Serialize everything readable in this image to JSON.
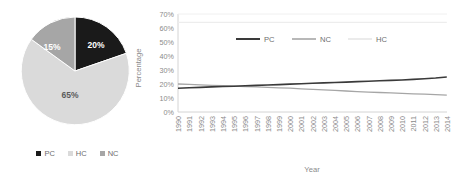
{
  "chart_data": [
    {
      "type": "pie",
      "title": "",
      "labels": [
        "PC",
        "HC",
        "NC"
      ],
      "values": [
        20,
        65,
        15
      ],
      "value_labels": [
        "20%",
        "65%",
        "15%"
      ],
      "colors": [
        "#1a1a1a",
        "#dadada",
        "#a6a6a6"
      ],
      "legend_position": "bottom",
      "start_angle_deg": 0,
      "direction": "clockwise",
      "legend": [
        "PC",
        "HC",
        "NC"
      ]
    },
    {
      "type": "line",
      "title": "",
      "xlabel": "Year",
      "ylabel": "Percentage",
      "ylim": [
        0,
        70
      ],
      "yticks": [
        0,
        10,
        20,
        30,
        40,
        50,
        60,
        70
      ],
      "ytick_labels": [
        "0%",
        "10%",
        "20%",
        "30%",
        "40%",
        "50%",
        "60%",
        "70%"
      ],
      "grid": false,
      "legend_position": "top-center-inside",
      "categories": [
        "1990",
        "1991",
        "1992",
        "1993",
        "1994",
        "1995",
        "1996",
        "1997",
        "1998",
        "1999",
        "2000",
        "2001",
        "2002",
        "2003",
        "2004",
        "2005",
        "2006",
        "2007",
        "2008",
        "2009",
        "2010",
        "2011",
        "2012",
        "2013",
        "2014"
      ],
      "series": [
        {
          "name": "PC",
          "color": "#3a3a3a",
          "width": 1.6,
          "values": [
            17.0,
            17.3,
            17.6,
            17.9,
            18.2,
            18.4,
            18.7,
            19.0,
            19.3,
            19.6,
            19.9,
            20.2,
            20.5,
            20.8,
            21.1,
            21.4,
            21.7,
            22.0,
            22.3,
            22.6,
            22.9,
            23.3,
            23.8,
            24.3,
            25.0
          ]
        },
        {
          "name": "NC",
          "color": "#a6a6a6",
          "width": 1.3,
          "values": [
            20.0,
            19.7,
            19.4,
            19.1,
            18.8,
            18.5,
            18.2,
            17.9,
            17.6,
            17.3,
            17.0,
            16.6,
            16.2,
            15.8,
            15.4,
            15.0,
            14.6,
            14.2,
            13.9,
            13.6,
            13.3,
            13.0,
            12.7,
            12.4,
            12.0
          ]
        },
        {
          "name": "HC",
          "color": "#ededed",
          "width": 1.2,
          "values": [
            64.0,
            64.0,
            64.0,
            64.0,
            64.0,
            64.0,
            64.0,
            64.0,
            64.0,
            64.0,
            64.0,
            64.0,
            64.0,
            64.0,
            64.0,
            64.0,
            64.0,
            64.0,
            64.0,
            64.0,
            64.0,
            64.0,
            64.0,
            64.0,
            64.0
          ]
        }
      ],
      "legend": [
        "PC",
        "NC",
        "HC"
      ]
    }
  ],
  "pie": {
    "slices": [
      {
        "label": "PC",
        "value_label": "20%"
      },
      {
        "label": "HC",
        "value_label": "65%"
      },
      {
        "label": "NC",
        "value_label": "15%"
      }
    ],
    "legend": [
      {
        "label": "PC"
      },
      {
        "label": "HC"
      },
      {
        "label": "NC"
      }
    ]
  },
  "line": {
    "ylabel": "Percentage",
    "xlabel": "Year",
    "ytick_labels": [
      "70%",
      "60%",
      "50%",
      "40%",
      "30%",
      "20%",
      "10%",
      "0%"
    ],
    "xtick_labels": [
      "1990",
      "1991",
      "1992",
      "1993",
      "1994",
      "1995",
      "1996",
      "1997",
      "1998",
      "1999",
      "2000",
      "2001",
      "2002",
      "2003",
      "2004",
      "2005",
      "2006",
      "2007",
      "2008",
      "2009",
      "2010",
      "2011",
      "2012",
      "2013",
      "2014"
    ],
    "legend": [
      {
        "label": "PC"
      },
      {
        "label": "NC"
      },
      {
        "label": "HC"
      }
    ]
  }
}
